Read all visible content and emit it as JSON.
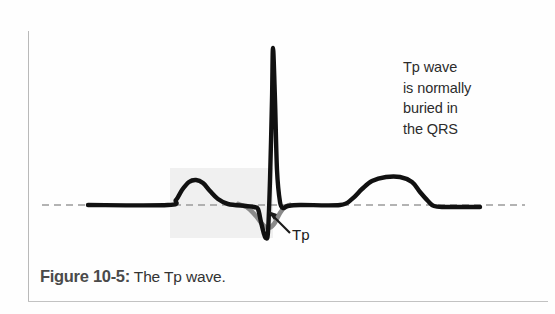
{
  "figure": {
    "caption_number": "Figure 10-5:",
    "caption_text": "The Tp wave.",
    "annotation_note": "Tp wave\nis normally\nburied in\nthe QRS",
    "tp_label": "Tp",
    "colors": {
      "trace": "#111111",
      "tp_trace": "#8a8a8a",
      "shaded_box": "#f0f0f0",
      "baseline_dash": "#9a9a9a",
      "border": "#bdbdbd",
      "caption_bold": "#4a4a4a",
      "caption_regular": "#333333",
      "note_text": "#2c2c2c"
    }
  },
  "chart_data": {
    "type": "line",
    "title": "Figure 10-5: The Tp wave.",
    "xlabel": "",
    "ylabel": "",
    "grid": false,
    "legend": "none",
    "annotations": [
      {
        "text": "Tp wave is normally buried in the QRS",
        "x": 403,
        "y": 57
      },
      {
        "text": "Tp",
        "x": 292,
        "y": 226,
        "arrow_from": [
          289,
          232
        ],
        "arrow_to": [
          268,
          212
        ]
      }
    ],
    "baseline_y": 205,
    "baseline_dashed_range": [
      42,
      525
    ],
    "shaded_region": {
      "x0": 170,
      "x1": 273,
      "y0": 168,
      "y1": 238,
      "color": "#f0f0f0"
    },
    "series": [
      {
        "name": "ECG trace",
        "color": "#111111",
        "points": [
          [
            88,
            205
          ],
          [
            168,
            205
          ],
          [
            176,
            200
          ],
          [
            182,
            190
          ],
          [
            189,
            182
          ],
          [
            196,
            180
          ],
          [
            203,
            183
          ],
          [
            210,
            191
          ],
          [
            218,
            199
          ],
          [
            228,
            204
          ],
          [
            246,
            206
          ],
          [
            254,
            207
          ],
          [
            258,
            209
          ],
          [
            261,
            222
          ],
          [
            264,
            234
          ],
          [
            266,
            238
          ],
          [
            268,
            232
          ],
          [
            270,
            180
          ],
          [
            272,
            100
          ],
          [
            273,
            48
          ],
          [
            275,
            100
          ],
          [
            277,
            170
          ],
          [
            280,
            202
          ],
          [
            283,
            208
          ],
          [
            288,
            206
          ],
          [
            300,
            205
          ],
          [
            340,
            205
          ],
          [
            352,
            199
          ],
          [
            362,
            189
          ],
          [
            372,
            181
          ],
          [
            386,
            177
          ],
          [
            400,
            177
          ],
          [
            412,
            182
          ],
          [
            420,
            192
          ],
          [
            428,
            201
          ],
          [
            434,
            206
          ],
          [
            445,
            207
          ],
          [
            480,
            207
          ]
        ]
      },
      {
        "name": "Tp wave (atrial repolarization)",
        "color": "#8a8a8a",
        "points": [
          [
            238,
            204
          ],
          [
            248,
            208
          ],
          [
            256,
            216
          ],
          [
            262,
            224
          ],
          [
            268,
            228
          ],
          [
            274,
            224
          ],
          [
            280,
            213
          ],
          [
            285,
            207
          ],
          [
            290,
            205
          ]
        ]
      }
    ]
  }
}
